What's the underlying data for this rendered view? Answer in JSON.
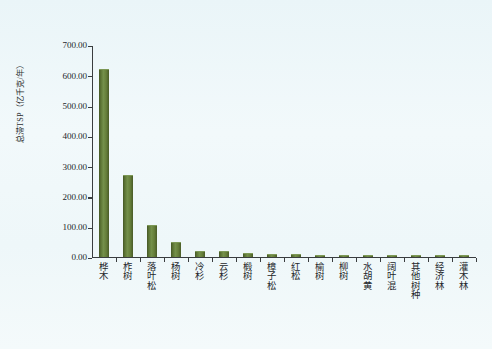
{
  "chart_data": {
    "type": "bar",
    "title": "",
    "xlabel": "",
    "ylabel": "总滞TSP（亿千克/年）",
    "ylim": [
      0,
      700
    ],
    "ytick_step": 100,
    "grid": false,
    "legend": "none",
    "bar_color": "#5c7434",
    "background_color": "#eef7f9",
    "axis_color": "#3a3d3f",
    "categories": [
      "桦木",
      "柞树",
      "落叶松",
      "杨树",
      "冷杉",
      "云杉",
      "椴树",
      "樟子松",
      "红松",
      "榆树",
      "柳树",
      "水胡黄",
      "阔叶混",
      "其他树种",
      "经济林",
      "灌木林"
    ],
    "values": [
      618,
      270,
      105,
      47,
      20,
      18,
      11,
      10,
      8,
      6,
      6,
      5,
      5,
      4,
      3,
      3
    ],
    "ytick_labels": [
      "700.00",
      "600.00",
      "500.00",
      "400.00",
      "300.00",
      "200.00",
      "100.00",
      "0.00"
    ],
    "ytick_values": [
      700,
      600,
      500,
      400,
      300,
      200,
      100,
      0
    ]
  }
}
